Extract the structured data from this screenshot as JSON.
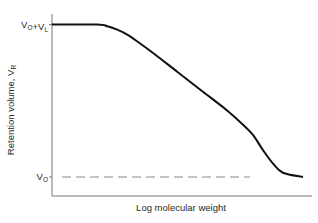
{
  "chart_data": {
    "type": "line",
    "title": "",
    "xlabel": "Log molecular weight",
    "ylabel": {
      "main": "Retention volume, V",
      "sub": "R"
    },
    "grid": false,
    "legend": "none",
    "xlim": [
      0,
      100
    ],
    "ylim": [
      0,
      100
    ],
    "y_tick_labels": [
      {
        "value": 100,
        "parts": [
          {
            "t": "V",
            "sub": "O"
          },
          {
            "t": "+V",
            "sub": "L"
          }
        ]
      },
      {
        "value": 10,
        "parts": [
          {
            "t": "V",
            "sub": "O"
          }
        ]
      }
    ],
    "series": [
      {
        "name": "Retention curve",
        "style": "solid",
        "color": "#111111",
        "x": [
          0,
          18,
          22,
          26,
          30,
          34,
          40,
          50,
          60,
          70,
          76,
          80,
          84,
          88,
          92,
          100
        ],
        "y": [
          100,
          100,
          99,
          97,
          94,
          90,
          83.5,
          72,
          60.5,
          49,
          41,
          35,
          26,
          18,
          12.5,
          10
        ]
      },
      {
        "name": "V0 reference",
        "style": "dashed",
        "color": "#888888",
        "x": [
          0,
          100
        ],
        "y": [
          10,
          10
        ]
      }
    ]
  }
}
